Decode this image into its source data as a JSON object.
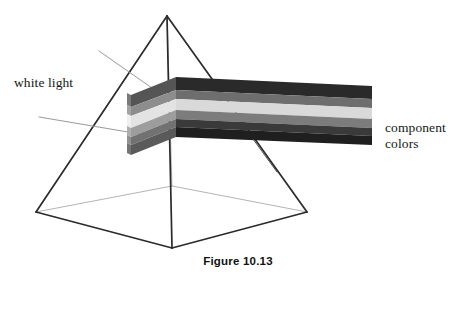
{
  "figure": {
    "caption": "Figure 10.13",
    "background_color": "#ffffff"
  },
  "labels": {
    "white_light": "white light",
    "component_colors": "component\ncolors",
    "component_colors_line1": "component",
    "component_colors_line2": "colors"
  },
  "prism": {
    "name": "square-based-pyramid-prism",
    "apex": {
      "x": 167,
      "y": 16
    },
    "base_left": {
      "x": 36,
      "y": 212
    },
    "base_front": {
      "x": 172,
      "y": 248
    },
    "base_right": {
      "x": 307,
      "y": 212
    },
    "base_back": {
      "x": 172,
      "y": 186
    },
    "visible_edge_color": "#2b2b2b",
    "hidden_edge_color": "#b2b2b2",
    "face_fill": "#ffffff"
  },
  "incident_beam": {
    "name": "white-light-rays",
    "color": "#9a9a9a",
    "ray_upper": {
      "x1": 99,
      "y1": 51,
      "x2": 149,
      "y2": 85
    },
    "ray_lower": {
      "x1": 39,
      "y1": 117,
      "x2": 138,
      "y2": 134
    }
  },
  "leader_line": {
    "name": "component-colors-leader",
    "color": "#3a3a3a",
    "x1": 253,
    "y1": 139,
    "x2": 276,
    "y2": 170
  },
  "spectrum_beam": {
    "name": "dispersed-spectrum-beam",
    "left_end_x": 131,
    "right_end_x": 372,
    "bend_x": 176,
    "bands": [
      {
        "index": 0,
        "name": "band-dark-top",
        "color": "#2a2a2a"
      },
      {
        "index": 1,
        "name": "band-mid-gray-upper",
        "color": "#6e6e6e"
      },
      {
        "index": 2,
        "name": "band-light",
        "color": "#d9d9d9"
      },
      {
        "index": 3,
        "name": "band-mid-gray-lower",
        "color": "#7c7c7c"
      },
      {
        "index": 4,
        "name": "band-dark-bottom",
        "color": "#3a3a3a"
      },
      {
        "index": 5,
        "name": "band-darkest-bottom",
        "color": "#1f1f1f"
      }
    ],
    "end_face_bands": [
      {
        "index": 0,
        "name": "endface-band-0",
        "color": "#6f6f6f"
      },
      {
        "index": 1,
        "name": "endface-band-1",
        "color": "#9b9b9b"
      },
      {
        "index": 2,
        "name": "endface-band-2",
        "color": "#efefef"
      },
      {
        "index": 3,
        "name": "endface-band-3",
        "color": "#a6a6a6"
      },
      {
        "index": 4,
        "name": "endface-band-4",
        "color": "#8a8a8a"
      },
      {
        "index": 5,
        "name": "endface-band-5",
        "color": "#6a6a6a"
      }
    ]
  }
}
